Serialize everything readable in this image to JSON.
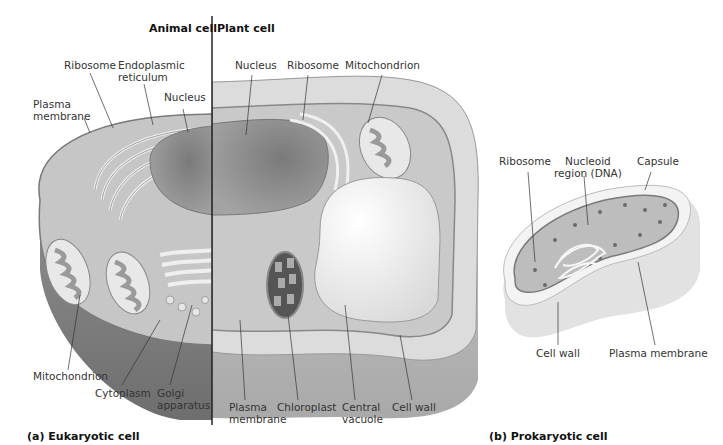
{
  "headers": {
    "animal": "Animal cell",
    "plant": "Plant cell"
  },
  "eukaryotic": {
    "caption": "(a) Eukaryotic cell",
    "labels": {
      "ribosome_animal": "Ribosome",
      "er": "Endoplasmic\nreticulum",
      "nucleus_animal": "Nucleus",
      "plasma_membrane_animal": "Plasma\nmembrane",
      "nucleus_plant": "Nucleus",
      "ribosome_plant": "Ribosome",
      "mitochondrion_plant": "Mitochondrion",
      "mitochondrion_animal": "Mitochondrion",
      "cytoplasm": "Cytoplasm",
      "golgi": "Golgi\napparatus",
      "plasma_membrane_plant": "Plasma\nmembrane",
      "chloroplast": "Chloroplast",
      "central_vacuole": "Central\nvacuole",
      "cell_wall": "Cell wall"
    }
  },
  "prokaryotic": {
    "caption": "(b) Prokaryotic cell",
    "labels": {
      "ribosome": "Ribosome",
      "nucleoid": "Nucleoid\nregion (DNA)",
      "capsule": "Capsule",
      "cell_wall": "Cell wall",
      "plasma_membrane": "Plasma membrane"
    }
  },
  "colors": {
    "cytoplasm": "#c9c9c9",
    "cell_edge": "#8a8a8a",
    "nucleus": "#8f8f8f",
    "vacuole": "#f2f2f2",
    "cell_wall": "#d8d8d8",
    "text": "#333333"
  }
}
